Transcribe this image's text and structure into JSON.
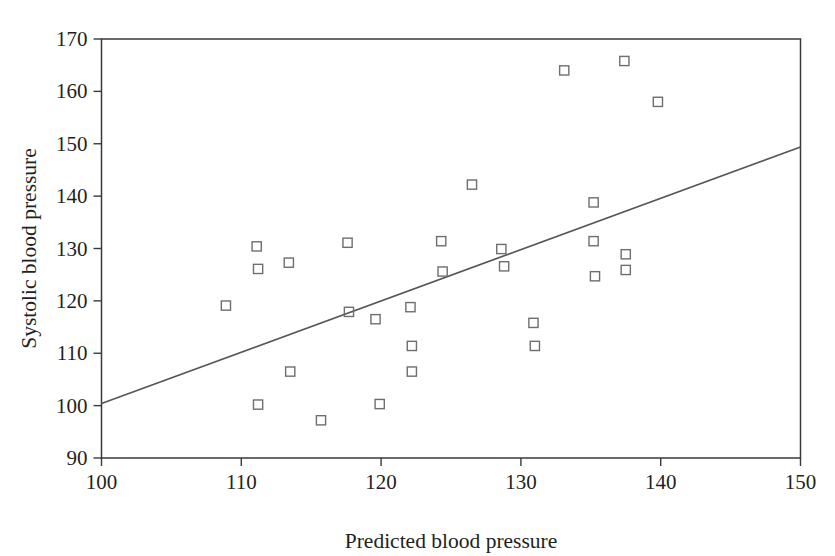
{
  "chart_data": {
    "type": "scatter",
    "title": "",
    "xlabel": "Predicted blood pressure",
    "ylabel": "Systolic blood pressure",
    "xlim": [
      100,
      150
    ],
    "ylim": [
      90,
      170
    ],
    "xticks": [
      100,
      110,
      120,
      130,
      140,
      150
    ],
    "yticks": [
      90,
      100,
      110,
      120,
      130,
      140,
      150,
      160,
      170
    ],
    "xtick_labels": [
      "100",
      "110",
      "120",
      "130",
      "140",
      "150"
    ],
    "ytick_labels": [
      "90",
      "100",
      "110",
      "120",
      "130",
      "140",
      "150",
      "160",
      "170"
    ],
    "grid": false,
    "legend": null,
    "marker": "open-square",
    "marker_color": "#6e6e72",
    "line_color": "#55555a",
    "axis_color": "#3a3a3a",
    "series": [
      {
        "name": "Observations",
        "points": [
          [
            108.9,
            119.1
          ],
          [
            111.1,
            130.4
          ],
          [
            111.2,
            126.1
          ],
          [
            113.4,
            127.3
          ],
          [
            113.5,
            106.5
          ],
          [
            111.2,
            100.2
          ],
          [
            115.7,
            97.2
          ],
          [
            117.6,
            131.1
          ],
          [
            117.7,
            117.9
          ],
          [
            119.6,
            116.5
          ],
          [
            119.9,
            100.3
          ],
          [
            122.1,
            118.8
          ],
          [
            122.2,
            111.4
          ],
          [
            122.2,
            106.5
          ],
          [
            124.3,
            131.4
          ],
          [
            124.4,
            125.6
          ],
          [
            126.5,
            142.2
          ],
          [
            128.6,
            129.9
          ],
          [
            128.8,
            126.6
          ],
          [
            130.9,
            115.8
          ],
          [
            131.0,
            111.4
          ],
          [
            133.1,
            164.0
          ],
          [
            135.2,
            138.8
          ],
          [
            135.2,
            131.4
          ],
          [
            135.3,
            124.7
          ],
          [
            137.4,
            165.8
          ],
          [
            137.5,
            128.9
          ],
          [
            137.5,
            125.9
          ],
          [
            139.8,
            158.0
          ]
        ]
      }
    ],
    "fit_line": {
      "name": "Regression line",
      "x": [
        100,
        150
      ],
      "y": [
        100.4,
        149.4
      ]
    }
  },
  "axis_labels": {
    "x_title": "Predicted blood pressure",
    "y_title": "Systolic blood pressure"
  }
}
